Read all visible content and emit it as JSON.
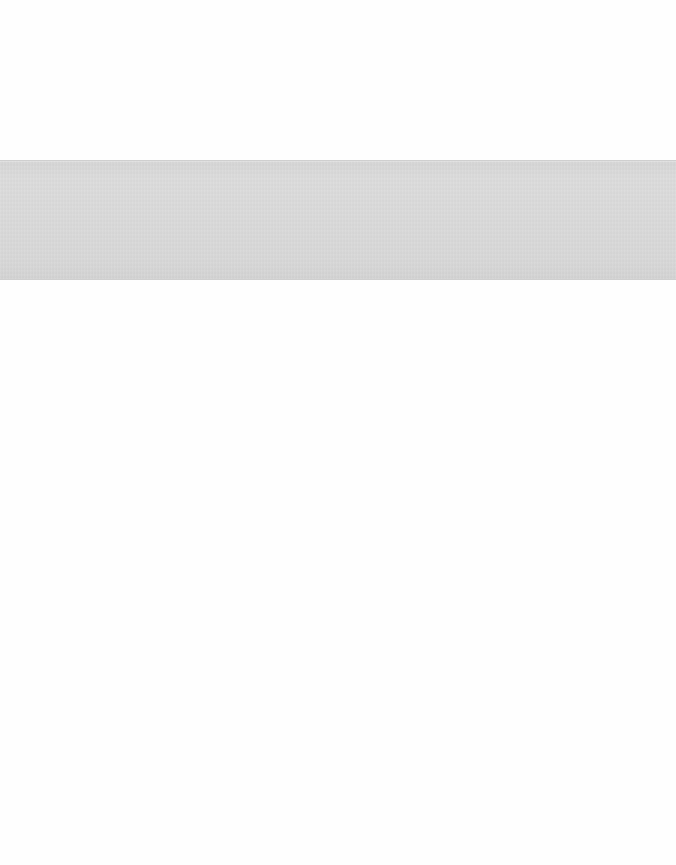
{
  "page": {
    "background_color": "#fefefe"
  },
  "banner": {
    "text": "",
    "background_color": "#d9d9d9",
    "border_color": "#cfcfcf"
  }
}
